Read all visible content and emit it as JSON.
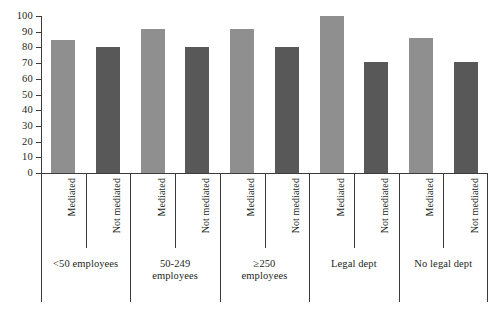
{
  "chart_data": {
    "type": "bar",
    "title": "",
    "subtitle": "",
    "xlabel": "",
    "ylabel": "",
    "ylim": [
      0,
      100
    ],
    "yticks": [
      0,
      10,
      20,
      30,
      40,
      50,
      60,
      70,
      80,
      90,
      100
    ],
    "grid": false,
    "legend": "none",
    "categories": [
      "<50 employees",
      "50-249 employees",
      "≥250 employees",
      "Legal dept",
      "No legal dept"
    ],
    "subcategories": [
      "Mediated",
      "Not mediated"
    ],
    "series": [
      {
        "name": "Mediated",
        "values": [
          85,
          92,
          92,
          100,
          86
        ]
      },
      {
        "name": "Not mediated",
        "values": [
          80,
          80,
          80,
          71,
          71
        ]
      }
    ],
    "bars": [
      {
        "group": "<50 employees",
        "group_lines": [
          "<50 employees"
        ],
        "subcategory": "Mediated",
        "value": 85,
        "color": "#8f8f8f"
      },
      {
        "group": "<50 employees",
        "group_lines": [
          "<50 employees"
        ],
        "subcategory": "Not mediated",
        "value": 80,
        "color": "#585858"
      },
      {
        "group": "50-249 employees",
        "group_lines": [
          "50-249",
          "employees"
        ],
        "subcategory": "Mediated",
        "value": 92,
        "color": "#8f8f8f"
      },
      {
        "group": "50-249 employees",
        "group_lines": [
          "50-249",
          "employees"
        ],
        "subcategory": "Not mediated",
        "value": 80,
        "color": "#585858"
      },
      {
        "group": "≥250 employees",
        "group_lines": [
          "≥250",
          "employees"
        ],
        "subcategory": "Mediated",
        "value": 92,
        "color": "#8f8f8f"
      },
      {
        "group": "≥250 employees",
        "group_lines": [
          "≥250",
          "employees"
        ],
        "subcategory": "Not mediated",
        "value": 80,
        "color": "#585858"
      },
      {
        "group": "Legal dept",
        "group_lines": [
          "Legal dept"
        ],
        "subcategory": "Mediated",
        "value": 100,
        "color": "#8f8f8f"
      },
      {
        "group": "Legal dept",
        "group_lines": [
          "Legal dept"
        ],
        "subcategory": "Not mediated",
        "value": 71,
        "color": "#585858"
      },
      {
        "group": "No legal dept",
        "group_lines": [
          "No legal dept"
        ],
        "subcategory": "Mediated",
        "value": 86,
        "color": "#8f8f8f"
      },
      {
        "group": "No legal dept",
        "group_lines": [
          "No legal dept"
        ],
        "subcategory": "Not mediated",
        "value": 71,
        "color": "#585858"
      }
    ],
    "colors": {
      "mediated": "#8f8f8f",
      "not_mediated": "#585858",
      "axis": "#3d3a39",
      "background": "#ffffff",
      "text": "#231f20"
    }
  }
}
